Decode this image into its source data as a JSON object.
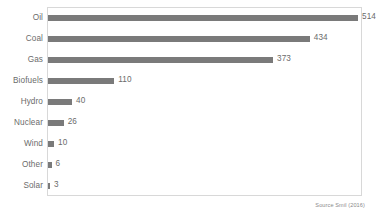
{
  "chart_data": {
    "type": "bar",
    "orientation": "horizontal",
    "title": "",
    "subtitle": "",
    "xlabel": "",
    "ylabel": "",
    "categories": [
      "Oil",
      "Coal",
      "Gas",
      "Biofuels",
      "Hydro",
      "Nuclear",
      "Wind",
      "Other",
      "Solar"
    ],
    "values": [
      514,
      434,
      373,
      110,
      40,
      26,
      10,
      6,
      3
    ],
    "value_labels": [
      "514",
      "434",
      "373",
      "110",
      "40",
      "26",
      "10",
      "6",
      "3"
    ],
    "xlim": [
      0,
      514
    ],
    "grid": false,
    "legend": null,
    "bar_color": "#7a7a7a",
    "text_color": "#6b6b6b",
    "frame_color": "#d8d8d8",
    "annotations": [
      "Source Smil (2016)"
    ]
  },
  "figure": {
    "source_note": "Source Smil (2016)"
  }
}
